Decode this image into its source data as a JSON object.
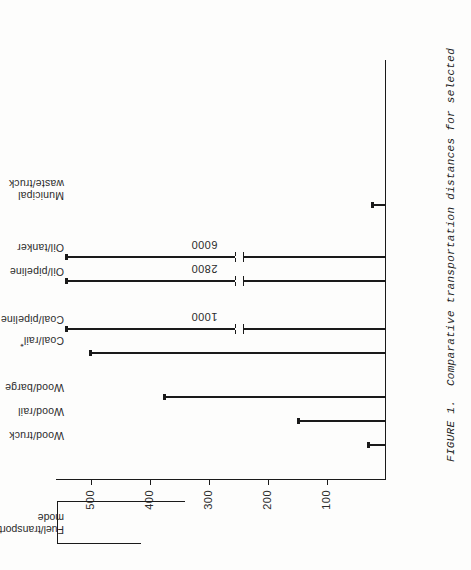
{
  "figure": {
    "caption_line1": "FIGURE 1.  Comparative transportation distances for selected",
    "caption_line2": "fuels [6,7].  (*) assumes 50% unit trains.",
    "header_line1": "Fuel/transport",
    "header_line2": "mode"
  },
  "chart_data": {
    "type": "bar",
    "title": "",
    "orientation": "horizontal-rotated",
    "xlabel": "Fuel/transport mode",
    "ylabel": "",
    "categories": [
      "Wood/truck",
      "Wood/rail",
      "Wood/barge",
      "Coal/rail*",
      "Coal/pipeline",
      "Oil/pipeline",
      "Oil/tanker",
      "Municipal waste/truck"
    ],
    "values": [
      30,
      150,
      375,
      500,
      1000,
      2800,
      6000,
      25
    ],
    "value_labels": [
      "",
      "",
      "",
      "",
      "1000",
      "2800",
      "6000",
      ""
    ],
    "broken_axis": [
      false,
      false,
      false,
      false,
      true,
      true,
      true,
      false
    ],
    "axis_ticks": [
      100,
      200,
      300,
      400,
      500
    ],
    "axis_tick_labels": [
      "100",
      "200",
      "300",
      "400",
      "500"
    ],
    "ylim": [
      0,
      560
    ],
    "grid": false,
    "legend": "none"
  }
}
